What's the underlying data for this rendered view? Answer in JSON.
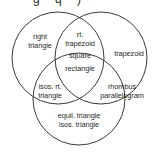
{
  "figure": {
    "width": 159,
    "height": 159,
    "background_color": "#ffffff",
    "stroke_color": "#3a3a3a",
    "text_color": "#2b2b2b"
  },
  "top_clipped_caption": "g q )",
  "circles": [
    {
      "id": "left",
      "name": "left-circle",
      "cx": 58,
      "cy": 58,
      "r": 46
    },
    {
      "id": "right",
      "name": "right-circle",
      "cx": 101,
      "cy": 58,
      "r": 46
    },
    {
      "id": "bottom",
      "name": "bottom-circle",
      "cx": 79,
      "cy": 99,
      "r": 46
    }
  ],
  "regions": [
    {
      "id": "left-only",
      "name": "right-triangle-region",
      "lines": [
        "right",
        "triangle"
      ]
    },
    {
      "id": "left-right",
      "name": "rt-trapezoid-region",
      "lines": [
        "rt.",
        "trapezoid"
      ]
    },
    {
      "id": "right-only",
      "name": "trapezoid-region",
      "lines": [
        "trapezoid"
      ]
    },
    {
      "id": "center-all",
      "name": "square-rectangle-region",
      "lines": [
        "square",
        "rectangle"
      ]
    },
    {
      "id": "left-bottom",
      "name": "isosceles-right-triangle-region",
      "lines": [
        "isos. rt.",
        "triangle"
      ]
    },
    {
      "id": "right-bottom",
      "name": "rhombus-parallelogram-region",
      "lines": [
        "rhombus",
        "parallelogram"
      ]
    },
    {
      "id": "bottom-only",
      "name": "equilateral-isosceles-triangle-region",
      "lines": [
        "equil. triangle",
        "isos. triangle"
      ]
    }
  ]
}
